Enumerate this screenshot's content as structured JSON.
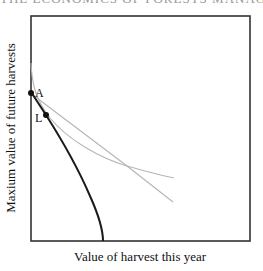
{
  "header": {
    "clipped_text": "THE ECONOMICS OF FORESTS MANAGEMENT"
  },
  "diagram": {
    "x_axis_label": "Value of harvest this year",
    "y_axis_label": "Maxium value of future harvests",
    "points": [
      {
        "label": "A",
        "x": 31,
        "y": 93
      },
      {
        "label": "L",
        "x": 46,
        "y": 115
      }
    ],
    "curves": [
      {
        "name": "production-possibility-frontier",
        "style": "thick-black"
      },
      {
        "name": "indifference-curve",
        "style": "thin-gray"
      },
      {
        "name": "price-line",
        "style": "thin-gray"
      }
    ],
    "colors": {
      "axis": "#222222",
      "frontier": "#1a1a1a",
      "gray_lines": "#b5b5b5"
    }
  }
}
